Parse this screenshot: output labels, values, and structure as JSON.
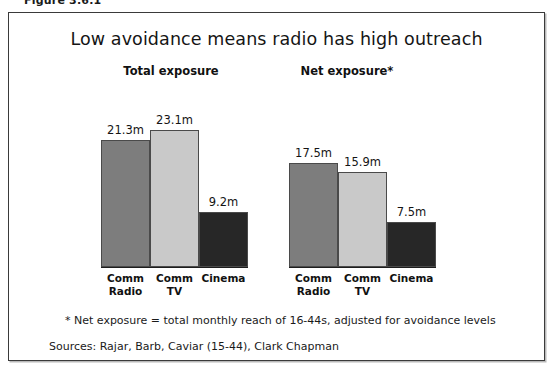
{
  "figure": {
    "caption": "Figure 3.6.1"
  },
  "chart_data": {
    "type": "bar",
    "title": "Low avoidance means radio has high outreach",
    "xlabel": "",
    "ylabel": "",
    "ylim": [
      0,
      25
    ],
    "grid": false,
    "legend": "none",
    "categories": [
      "Comm\nRadio",
      "Comm\nTV",
      "Cinema"
    ],
    "groups": [
      {
        "name": "Total exposure",
        "heading": "Total exposure",
        "values": [
          21.3,
          23.1,
          9.2
        ],
        "labels": [
          "21.3m",
          "23.1m",
          "9.2m"
        ]
      },
      {
        "name": "Net exposure",
        "heading": "Net exposure*",
        "values": [
          17.5,
          15.9,
          7.5
        ],
        "labels": [
          "17.5m",
          "15.9m",
          "7.5m"
        ]
      }
    ],
    "series_colors": [
      "#7d7d7d",
      "#c9c9c9",
      "#272727"
    ],
    "annotations": [
      "* Net exposure = total monthly reach of 16-44s, adjusted for avoidance levels",
      "Sources: Rajar, Barb, Caviar (15-44), Clark Chapman"
    ]
  },
  "notes": {
    "footnote": "* Net exposure = total monthly reach of 16-44s, adjusted for avoidance levels",
    "sources": "Sources: Rajar, Barb, Caviar (15-44), Clark Chapman"
  }
}
